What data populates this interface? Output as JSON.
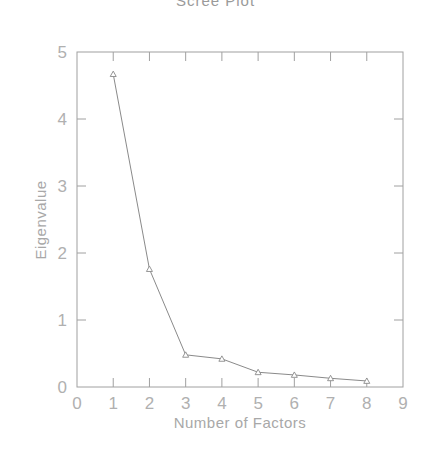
{
  "chart_data": {
    "type": "line",
    "title": "Scree Plot",
    "xlabel": "Number of Factors",
    "ylabel": "Eigenvalue",
    "x": [
      1,
      2,
      3,
      4,
      5,
      6,
      7,
      8
    ],
    "values": [
      4.67,
      1.76,
      0.48,
      0.42,
      0.22,
      0.18,
      0.13,
      0.09
    ],
    "series": [
      {
        "name": "Eigenvalue",
        "x": [
          1,
          2,
          3,
          4,
          5,
          6,
          7,
          8
        ],
        "values": [
          4.67,
          1.76,
          0.48,
          0.42,
          0.22,
          0.18,
          0.13,
          0.09
        ]
      }
    ],
    "xlim": [
      0,
      9
    ],
    "ylim": [
      0,
      5
    ],
    "xticks": [
      "0",
      "1",
      "2",
      "3",
      "4",
      "5",
      "6",
      "7",
      "8",
      "9"
    ],
    "yticks": [
      "0",
      "1",
      "2",
      "3",
      "4",
      "5"
    ],
    "marker": "triangle",
    "grid": false,
    "legend": "none"
  },
  "colors": {
    "line": "#8a8a8a",
    "axis": "#a0a0a0",
    "text": "#b0b0b0"
  }
}
